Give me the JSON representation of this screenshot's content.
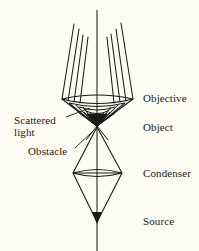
{
  "figure": {
    "background_color": "#fcfcf4",
    "ink_color": "#1c1a15"
  },
  "labels": {
    "objective": "Objective",
    "object": "Object",
    "condenser": "Condenser",
    "source": "Source",
    "scattered_light_line1": "Scattered",
    "scattered_light_line2": "light",
    "obstacle": "Obstacle"
  },
  "diagram": {
    "optical_axis": {
      "x": 97,
      "y_top": 10,
      "y_bottom": 251
    },
    "objective_lens": {
      "cx": 97,
      "cy": 100,
      "half_width": 36,
      "half_height": 5
    },
    "condenser_lens": {
      "cx": 97,
      "cy": 173,
      "half_width": 25,
      "half_height": 4
    },
    "object_point": {
      "x": 97,
      "y": 126
    },
    "source_point": {
      "x": 97,
      "y": 222
    },
    "upper_ray_fan_count": 8,
    "scattered_ray_count": 9
  }
}
